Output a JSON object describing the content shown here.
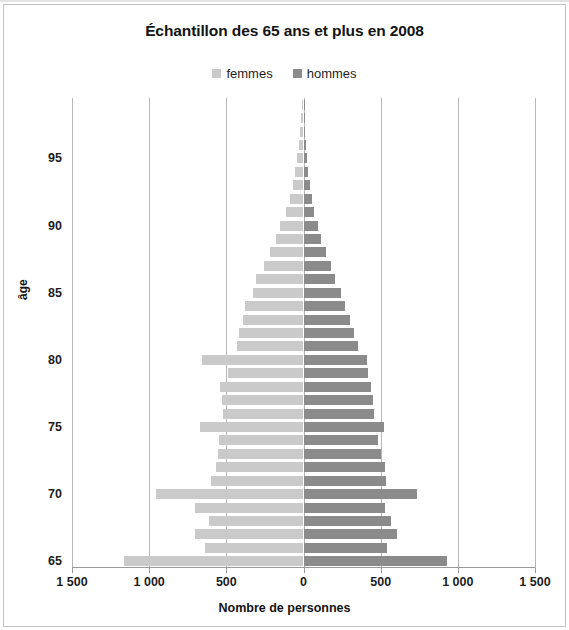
{
  "chart_data": {
    "type": "bar",
    "subtype": "population-pyramid",
    "title": "Échantillon des 65 ans et plus en 2008",
    "xlabel": "Nombre de personnes",
    "ylabel": "âge",
    "grid": true,
    "legend_position": "top",
    "xlim": [
      -1500,
      1500
    ],
    "xticks": [
      -1500,
      -1000,
      -500,
      0,
      500,
      1000,
      1500
    ],
    "xtick_labels": [
      "1 500",
      "1 000",
      "500",
      "0",
      "500",
      "1 000",
      "1 500"
    ],
    "yticks": [
      65,
      70,
      75,
      80,
      85,
      90,
      95
    ],
    "ytick_labels": [
      "65",
      "70",
      "75",
      "80",
      "85",
      "90",
      "95"
    ],
    "categories": [
      65,
      66,
      67,
      68,
      69,
      70,
      71,
      72,
      73,
      74,
      75,
      76,
      77,
      78,
      79,
      80,
      81,
      82,
      83,
      84,
      85,
      86,
      87,
      88,
      89,
      90,
      91,
      92,
      93,
      94,
      95,
      96,
      97,
      98,
      99
    ],
    "series": [
      {
        "name": "femmes",
        "color": "#cacaca",
        "side": "left",
        "values": [
          1165,
          640,
          700,
          610,
          700,
          955,
          600,
          565,
          555,
          550,
          670,
          520,
          525,
          540,
          490,
          655,
          430,
          420,
          390,
          380,
          330,
          305,
          255,
          215,
          175,
          150,
          115,
          90,
          70,
          55,
          40,
          30,
          22,
          15,
          10
        ]
      },
      {
        "name": "hommes",
        "color": "#8b8b8b",
        "side": "right",
        "values": [
          930,
          540,
          605,
          565,
          530,
          735,
          535,
          525,
          500,
          480,
          520,
          455,
          450,
          440,
          420,
          410,
          350,
          330,
          300,
          270,
          240,
          205,
          180,
          145,
          115,
          95,
          70,
          55,
          40,
          30,
          22,
          16,
          12,
          8,
          5
        ]
      }
    ]
  },
  "legend": {
    "items": [
      {
        "label": "femmes",
        "color": "#cacaca"
      },
      {
        "label": "hommes",
        "color": "#8b8b8b"
      }
    ]
  }
}
